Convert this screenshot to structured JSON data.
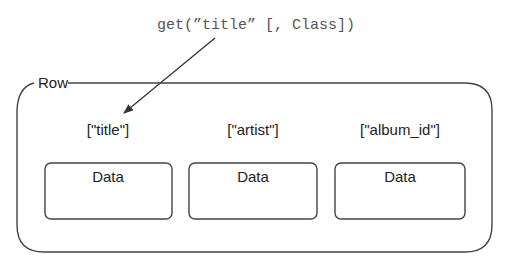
{
  "method_call": "get(”title” [, Class])",
  "row": {
    "label": "Row",
    "fields": [
      {
        "key": "[\"title\"]",
        "value": "Data"
      },
      {
        "key": "[\"artist\"]",
        "value": "Data"
      },
      {
        "key": "[\"album_id\"]",
        "value": "Data"
      }
    ]
  },
  "colors": {
    "stroke": "#444444",
    "code_text": "#555555",
    "text": "#222222",
    "background": "#ffffff"
  }
}
